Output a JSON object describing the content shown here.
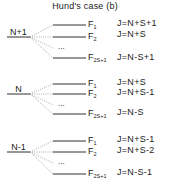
{
  "diagram": {
    "title": "Hund's case (b)",
    "groups": [
      {
        "name": "N+1",
        "levels": [
          {
            "f_main": "F",
            "f_sub": "1",
            "j": "J=N+S+1"
          },
          {
            "f_main": "F",
            "f_sub": "2",
            "j": "J=N+S"
          },
          {
            "f_main": "F",
            "f_sub": "2S+1",
            "j": "J=N-S+1"
          }
        ],
        "ellipsis": "..."
      },
      {
        "name": "N",
        "levels": [
          {
            "f_main": "F",
            "f_sub": "1",
            "j": "J=N+S"
          },
          {
            "f_main": "F",
            "f_sub": "2",
            "j": "J=N+S-1"
          },
          {
            "f_main": "F",
            "f_sub": "2S+1",
            "j": "J=N-S"
          }
        ],
        "ellipsis": "..."
      },
      {
        "name": "N-1",
        "levels": [
          {
            "f_main": "F",
            "f_sub": "1",
            "j": "J=N+S-1"
          },
          {
            "f_main": "F",
            "f_sub": "2",
            "j": "J=N+S-2"
          },
          {
            "f_main": "F",
            "f_sub": "2S+1",
            "j": "J=N-S-1"
          }
        ],
        "ellipsis": "..."
      }
    ],
    "colors": {
      "line": "#1a1a1a",
      "dotted": "#888888"
    }
  }
}
